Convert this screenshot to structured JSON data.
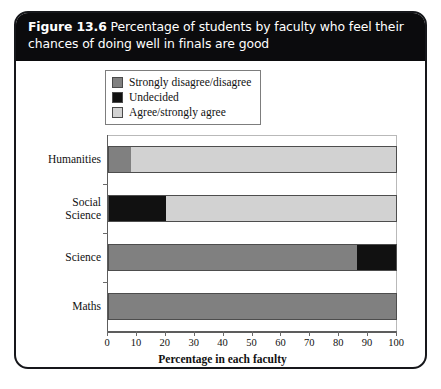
{
  "figure": {
    "number_label": "Figure 13.6",
    "caption": "Percentage of students by faculty who feel their chances of doing well in finals are good"
  },
  "colors": {
    "strongly_disagree": "#808080",
    "undecided": "#111111",
    "agree": "#d2d2d2",
    "banner_background": "#0b0b0d",
    "banner_text": "#ffffff",
    "frame": "#16171b"
  },
  "chart_data": {
    "type": "bar",
    "orientation": "horizontal",
    "stacked": true,
    "title": "Percentage of students by faculty who feel their chances of doing well in finals are good",
    "xlabel": "Percentage in each faculty",
    "ylabel": "Faculty",
    "xlim": [
      0,
      100
    ],
    "xticks": [
      0,
      10,
      20,
      30,
      40,
      50,
      60,
      70,
      80,
      90,
      100
    ],
    "xtick_labels": [
      "0",
      "10",
      "20",
      "30",
      "40",
      "50",
      "60",
      "70",
      "80",
      "90",
      "100"
    ],
    "grid": false,
    "legend_position": "top-left",
    "categories": [
      "Humanities",
      "Social Science",
      "Science",
      "Maths"
    ],
    "category_lines": [
      [
        "Humanities"
      ],
      [
        "Social",
        "Science"
      ],
      [
        "Science"
      ],
      [
        "Maths"
      ]
    ],
    "series": [
      {
        "name": "Strongly disagree/disagree",
        "color": "#808080",
        "values": [
          8,
          0,
          86,
          100
        ]
      },
      {
        "name": "Undecided",
        "color": "#111111",
        "values": [
          0,
          20,
          14,
          0
        ]
      },
      {
        "name": "Agree/strongly agree",
        "color": "#d2d2d2",
        "values": [
          92,
          80,
          0,
          0
        ]
      }
    ]
  },
  "legend": {
    "items": [
      {
        "label": "Strongly disagree/disagree",
        "color": "#808080"
      },
      {
        "label": "Undecided",
        "color": "#111111"
      },
      {
        "label": "Agree/strongly agree",
        "color": "#d2d2d2"
      }
    ]
  }
}
